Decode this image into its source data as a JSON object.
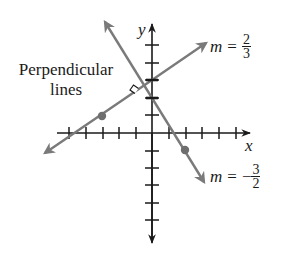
{
  "callout": {
    "line1": "Perpendicular",
    "line2": "lines"
  },
  "axes": {
    "x_label": "x",
    "y_label": "y",
    "x_ticks": [
      -5,
      -4,
      -3,
      -2,
      -1,
      1,
      2,
      3,
      4,
      5
    ],
    "y_ticks": [
      -5,
      -4,
      -3,
      -2,
      -1,
      1,
      2,
      3,
      4,
      5
    ]
  },
  "lines": [
    {
      "name": "line-positive-slope",
      "slope_label": {
        "m": "m",
        "eq": "=",
        "sign": "",
        "num": "2",
        "den": "3"
      },
      "slope": 0.6667,
      "y_intercept": 3,
      "marked_point": [
        -3,
        1
      ],
      "color": "#7a7a7a"
    },
    {
      "name": "line-negative-slope",
      "slope_label": {
        "m": "m",
        "eq": "=",
        "sign": "−",
        "num": "3",
        "den": "2"
      },
      "slope": -1.5,
      "y_intercept": 2,
      "marked_point": [
        2,
        -1
      ],
      "color": "#7a7a7a"
    }
  ],
  "colors": {
    "axis": "#1a1a1a",
    "line": "#7a7a7a",
    "point": "#6e6e6e",
    "text": "#1a1a1a",
    "background": "#ffffff"
  }
}
